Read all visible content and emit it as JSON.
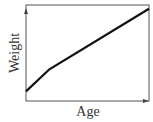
{
  "chart_data": {
    "type": "line",
    "title": "",
    "xlabel": "Age",
    "ylabel": "Weight",
    "grid": false,
    "legend": null,
    "series": [
      {
        "name": "Weight vs Age",
        "points": [
          [
            0,
            0.1
          ],
          [
            0.19,
            0.33
          ],
          [
            1.0,
            0.96
          ]
        ]
      }
    ],
    "xlim": [
      0,
      1
    ],
    "ylim": [
      0,
      1
    ]
  },
  "colors": {
    "axis": "#444444",
    "line": "#111111",
    "text": "#333333"
  }
}
